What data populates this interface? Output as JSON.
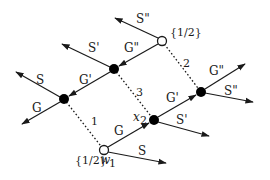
{
  "diagram": {
    "type": "graph",
    "colors": {
      "ink": "#1a1a1a",
      "background": "#ffffff"
    },
    "nodes": [
      {
        "id": "C",
        "kind": "open",
        "label": "{1/2}"
      },
      {
        "id": "A",
        "kind": "filled",
        "label": ""
      },
      {
        "id": "B",
        "kind": "filled",
        "label": ""
      },
      {
        "id": "F",
        "kind": "open",
        "label": "{1/2}",
        "sublabel": "w",
        "subscript": "1"
      },
      {
        "id": "D",
        "kind": "filled",
        "label": "x",
        "subscript": "2"
      },
      {
        "id": "E",
        "kind": "filled",
        "label": ""
      }
    ],
    "edges": [
      {
        "from": "C",
        "to": "out",
        "label": "S\"",
        "style": "arrow"
      },
      {
        "from": "C",
        "to": "A",
        "label": "G\"",
        "style": "arrow"
      },
      {
        "from": "A",
        "to": "out",
        "label": "S'",
        "style": "arrow"
      },
      {
        "from": "A",
        "to": "B",
        "label": "G'",
        "style": "arrow"
      },
      {
        "from": "B",
        "to": "out",
        "label": "S",
        "style": "arrow"
      },
      {
        "from": "B",
        "to": "out",
        "label": "G",
        "style": "arrow"
      },
      {
        "from": "F",
        "to": "D",
        "label": "G",
        "style": "arrow"
      },
      {
        "from": "F",
        "to": "out",
        "label": "S",
        "style": "arrow"
      },
      {
        "from": "D",
        "to": "E",
        "label": "G'",
        "style": "arrow"
      },
      {
        "from": "D",
        "to": "out",
        "label": "S'",
        "style": "arrow"
      },
      {
        "from": "E",
        "to": "out",
        "label": "G\"",
        "style": "arrow"
      },
      {
        "from": "E",
        "to": "out",
        "label": "S\"",
        "style": "arrow"
      },
      {
        "from": "B",
        "to": "F",
        "label": "1",
        "style": "dotted"
      },
      {
        "from": "A",
        "to": "D",
        "label": "3",
        "style": "dotted"
      },
      {
        "from": "C",
        "to": "E",
        "label": "2",
        "style": "dotted"
      }
    ],
    "labels": {
      "c_top": "{1/2}",
      "f_bottom": "{1/2}",
      "f_w": "w",
      "f_sub": "1",
      "d_x": "x",
      "d_sub": "2",
      "s_dd_top": "S\"",
      "g_dd_top": "G\"",
      "s_d_a": "S'",
      "g_d_a": "G'",
      "s_b": "S",
      "g_b": "G",
      "g_f": "G",
      "s_f": "S",
      "g_d_d": "G'",
      "s_d_d": "S'",
      "g_dd_e": "G\"",
      "s_dd_e": "S\"",
      "dot_1": "1",
      "dot_2": "2",
      "dot_3": "3"
    }
  }
}
